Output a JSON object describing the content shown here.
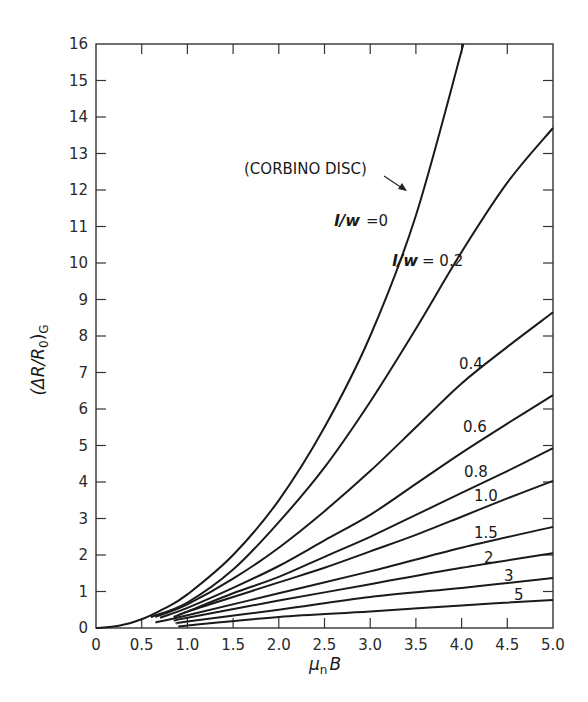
{
  "chart_data": {
    "type": "line",
    "title": "",
    "xlabel": "μnB",
    "ylabel": "(ΔR/R0)G",
    "xlim": [
      0,
      5.0
    ],
    "ylim": [
      0,
      16
    ],
    "grid": false,
    "x_ticks": [
      "0",
      "0.5",
      "1.0",
      "1.5",
      "2.0",
      "2.5",
      "3.0",
      "3.5",
      "4.0",
      "4.5",
      "5.0"
    ],
    "y_ticks": [
      "0",
      "1",
      "2",
      "3",
      "4",
      "5",
      "6",
      "7",
      "8",
      "9",
      "10",
      "11",
      "12",
      "13",
      "14",
      "15",
      "16"
    ],
    "annotations": [
      {
        "text": "(CORBINO DISC)",
        "arrow_to_series": "l/w = 0"
      }
    ],
    "series": [
      {
        "name": "l/w = 0",
        "label": "=0",
        "label_prefix": "l/w",
        "x": [
          0,
          0.25,
          0.5,
          0.75,
          1.0,
          1.5,
          2.0,
          2.5,
          3.0,
          3.5,
          4.02
        ],
        "y": [
          0,
          0.06,
          0.24,
          0.54,
          0.92,
          2.0,
          3.5,
          5.5,
          8.0,
          11.3,
          16.0
        ]
      },
      {
        "name": "l/w = 0.2",
        "label": "= 0.2",
        "label_prefix": "l/w",
        "x": [
          0.6,
          1.0,
          1.5,
          2.0,
          2.5,
          3.0,
          3.5,
          4.0,
          4.5,
          5.0
        ],
        "y": [
          0.3,
          0.7,
          1.6,
          2.9,
          4.4,
          6.2,
          8.2,
          10.3,
          12.2,
          13.7
        ]
      },
      {
        "name": "0.4",
        "label": "0.4",
        "x": [
          0.65,
          1.0,
          1.5,
          2.0,
          2.5,
          3.0,
          3.5,
          4.0,
          4.5,
          5.0
        ],
        "y": [
          0.3,
          0.65,
          1.35,
          2.2,
          3.2,
          4.3,
          5.5,
          6.7,
          7.7,
          8.65
        ]
      },
      {
        "name": "0.6",
        "label": "0.6",
        "x": [
          0.7,
          1.0,
          1.5,
          2.0,
          2.5,
          3.0,
          3.5,
          4.0,
          4.5,
          5.0
        ],
        "y": [
          0.28,
          0.55,
          1.1,
          1.7,
          2.4,
          3.1,
          3.95,
          4.8,
          5.6,
          6.38
        ]
      },
      {
        "name": "0.8",
        "label": "0.8",
        "x": [
          0.85,
          1.0,
          1.5,
          2.0,
          2.5,
          3.0,
          3.5,
          4.0,
          4.5,
          5.0
        ],
        "y": [
          0.3,
          0.45,
          0.95,
          1.4,
          1.95,
          2.5,
          3.1,
          3.7,
          4.3,
          4.93
        ]
      },
      {
        "name": "1.0",
        "label": "1.0",
        "x": [
          0.9,
          1.0,
          1.5,
          2.0,
          2.5,
          3.0,
          3.5,
          4.0,
          4.5,
          5.0
        ],
        "y": [
          0.35,
          0.45,
          0.85,
          1.25,
          1.65,
          2.1,
          2.55,
          3.05,
          3.55,
          4.03
        ]
      },
      {
        "name": "1.5",
        "label": "1.5",
        "x": [
          0.65,
          1.0,
          2.0,
          3.0,
          4.0,
          5.0
        ],
        "y": [
          0.15,
          0.35,
          0.95,
          1.55,
          2.2,
          2.77
        ]
      },
      {
        "name": "2",
        "label": "2",
        "x": [
          0.85,
          1.0,
          2.0,
          3.0,
          4.0,
          5.0
        ],
        "y": [
          0.2,
          0.28,
          0.75,
          1.2,
          1.65,
          2.05
        ]
      },
      {
        "name": "3",
        "label": "3",
        "x": [
          0.88,
          1.0,
          2.0,
          3.0,
          4.0,
          5.0
        ],
        "y": [
          0.12,
          0.18,
          0.5,
          0.85,
          1.1,
          1.37
        ]
      },
      {
        "name": "5",
        "label": "5",
        "x": [
          0.95,
          1.0,
          2.0,
          3.0,
          4.0,
          5.0
        ],
        "y": [
          0.05,
          0.07,
          0.3,
          0.45,
          0.62,
          0.77
        ]
      }
    ]
  },
  "labels": {
    "corbino": "(CORBINO DISC)",
    "lw_prefix": "l/w",
    "lw0_value": "=0",
    "lw02_value": "= 0.2",
    "c04": "0.4",
    "c06": "0.6",
    "c08": "0.8",
    "c10": "1.0",
    "c15": "1.5",
    "c2": "2",
    "c3": "3",
    "c5": "5",
    "ylabel_main": "(ΔR/R",
    "ylabel_sub0": "0",
    "ylabel_close": ")",
    "ylabel_subG": "G",
    "xlabel_mu": "μ",
    "xlabel_n": "n",
    "xlabel_B": "B"
  }
}
